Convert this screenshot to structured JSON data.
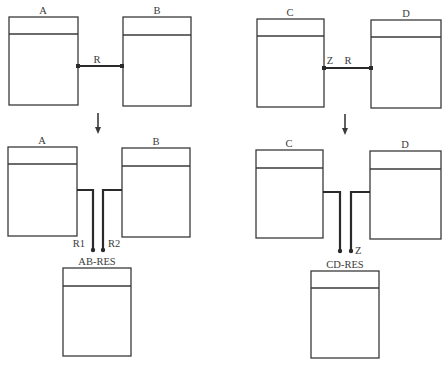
{
  "diagram": {
    "top_left": {
      "entities": [
        {
          "name": "A",
          "x": 9,
          "y": 17,
          "w": 69,
          "h": 88,
          "hdr": 17
        },
        {
          "name": "B",
          "x": 123,
          "y": 17,
          "w": 68,
          "h": 89,
          "hdr": 18
        }
      ],
      "relationship": {
        "label": "R"
      }
    },
    "top_right": {
      "entities": [
        {
          "name": "C",
          "x": 257,
          "y": 19,
          "w": 67,
          "h": 88,
          "hdr": 17
        },
        {
          "name": "D",
          "x": 371,
          "y": 20,
          "w": 70,
          "h": 88,
          "hdr": 17
        }
      ],
      "relationship": {
        "label": "R",
        "end_label": "Z"
      }
    },
    "bottom_left": {
      "entities": [
        {
          "name": "A",
          "x": 8,
          "y": 147,
          "w": 69,
          "h": 89,
          "hdr": 17
        },
        {
          "name": "B",
          "x": 122,
          "y": 148,
          "w": 68,
          "h": 89,
          "hdr": 18
        },
        {
          "name": "AB-RES",
          "x": 63,
          "y": 268,
          "w": 68,
          "h": 88,
          "hdr": 18
        }
      ],
      "relationships": [
        {
          "label": "R1"
        },
        {
          "label": "R2"
        }
      ]
    },
    "bottom_right": {
      "entities": [
        {
          "name": "C",
          "x": 256,
          "y": 150,
          "w": 67,
          "h": 88,
          "hdr": 18
        },
        {
          "name": "D",
          "x": 370,
          "y": 151,
          "w": 71,
          "h": 88,
          "hdr": 18
        },
        {
          "name": "CD-RES",
          "x": 311,
          "y": 271,
          "w": 68,
          "h": 87,
          "hdr": 17
        }
      ],
      "relationships": [
        {
          "label": "Z"
        }
      ]
    },
    "colors": {
      "line": "#3a3a3a",
      "connector": "#2a2a2a",
      "background": "#ffffff"
    }
  }
}
